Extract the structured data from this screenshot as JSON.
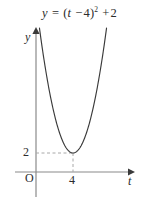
{
  "figure": {
    "width": 149,
    "height": 213,
    "background_color": "#ffffff"
  },
  "equation": {
    "y": "y",
    "equals": "=",
    "open_paren": "(",
    "t": "t",
    "minus": "−",
    "h": "4",
    "close_paren": ")",
    "exponent": "2",
    "plus": "+",
    "k": "2",
    "full_text": "y = (t − 4)² + 2"
  },
  "axes": {
    "y_label": "y",
    "x_label": "t",
    "origin_label": "O",
    "axis_color": "#8a8a8a",
    "x_axis_y_px": 172,
    "y_axis_x_px": 36
  },
  "ticks": {
    "y": [
      {
        "label": "2",
        "value": 2
      }
    ],
    "x": [
      {
        "label": "4",
        "value": 4
      }
    ]
  },
  "guides": {
    "color": "#a8a8a8",
    "style": "dashed",
    "horizontal_from_y_axis_to_vertex": true,
    "vertical_from_x_axis_to_vertex": true
  },
  "chart_data": {
    "type": "line",
    "xlabel": "t",
    "ylabel": "y",
    "curve_color": "#3a3a3a",
    "function": "y = (t - 4)^2 + 2",
    "vertex": {
      "t": 4,
      "y": 2
    },
    "xlim": [
      -0.6,
      8.2
    ],
    "ylim": [
      0,
      22
    ],
    "grid": false,
    "legend": null,
    "annotations": [
      {
        "text": "2",
        "axis": "y",
        "value": 2
      },
      {
        "text": "4",
        "axis": "x",
        "value": 4
      },
      {
        "text": "O",
        "axis": "origin",
        "value": 0
      }
    ],
    "x": [
      0.3,
      0.8,
      1.3,
      1.8,
      2.3,
      2.8,
      3.3,
      3.8,
      4.0,
      4.3,
      4.8,
      5.3,
      5.8,
      6.3,
      6.8,
      7.3,
      7.7
    ],
    "values": [
      15.69,
      12.24,
      9.29,
      6.84,
      4.89,
      3.44,
      2.49,
      2.04,
      2.0,
      2.09,
      2.64,
      3.69,
      5.24,
      7.29,
      9.84,
      12.89,
      15.69
    ]
  }
}
